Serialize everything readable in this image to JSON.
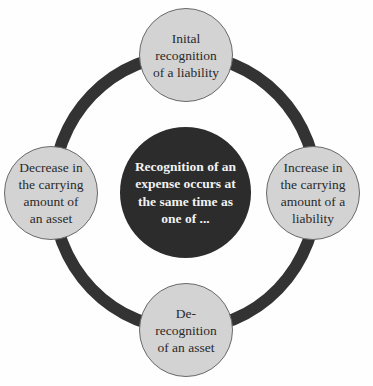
{
  "diagram": {
    "type": "hub-and-ring",
    "colors": {
      "ring": "#333333",
      "center_fill": "#2c2c2c",
      "center_text": "#f2f2f2",
      "outer_fill": "#d3d3d3",
      "outer_border": "#6a6a6a",
      "outer_text": "#2a2a2a"
    },
    "center": {
      "text": "Recognition of an expense occurs at the same time as one of ..."
    },
    "nodes": {
      "top": {
        "lines": [
          "Inital",
          "recognition",
          "of a liability"
        ]
      },
      "right": {
        "lines": [
          "Increase in",
          "the carrying",
          "amount of a",
          "liability"
        ]
      },
      "bottom": {
        "lines": [
          "De-",
          "recognition",
          "of an asset"
        ]
      },
      "left": {
        "lines": [
          "Decrease in",
          "the carrying",
          "amount of",
          "an asset"
        ]
      }
    }
  }
}
